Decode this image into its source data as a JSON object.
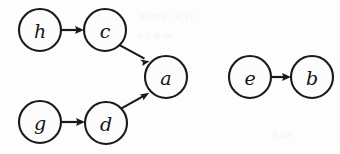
{
  "diagram": {
    "type": "directed-graph",
    "canvas": {
      "width": 340,
      "height": 154,
      "background": "#fdfdfd"
    },
    "style": {
      "node_fill": "#fcfcfc",
      "node_stroke": "#1a1a1a",
      "node_stroke_width": 2.1,
      "node_radius": 21,
      "edge_stroke": "#1a1a1a",
      "edge_stroke_width": 2.2,
      "label_color": "#141414",
      "label_font_size": 19
    },
    "nodes": [
      {
        "id": "h",
        "label": "h",
        "cx": 40,
        "cy": 30,
        "r": 21
      },
      {
        "id": "c",
        "label": "c",
        "cx": 105,
        "cy": 30,
        "r": 21
      },
      {
        "id": "a",
        "label": "a",
        "cx": 166,
        "cy": 77,
        "r": 21
      },
      {
        "id": "g",
        "label": "g",
        "cx": 40,
        "cy": 122,
        "r": 21
      },
      {
        "id": "d",
        "label": "d",
        "cx": 106,
        "cy": 123,
        "r": 21
      },
      {
        "id": "e",
        "label": "e",
        "cx": 250,
        "cy": 77,
        "r": 21
      },
      {
        "id": "b",
        "label": "b",
        "cx": 312,
        "cy": 77,
        "r": 21
      }
    ],
    "edges": [
      {
        "id": "h-c",
        "from": "h",
        "to": "c",
        "directed": true
      },
      {
        "id": "c-a",
        "from": "c",
        "to": "a",
        "directed": true
      },
      {
        "id": "g-d",
        "from": "g",
        "to": "d",
        "directed": true
      },
      {
        "id": "d-a",
        "from": "d",
        "to": "a",
        "directed": true
      },
      {
        "id": "e-b",
        "from": "e",
        "to": "b",
        "directed": true
      }
    ],
    "components": [
      {
        "id": "component-1",
        "nodes": [
          "h",
          "c",
          "g",
          "d",
          "a"
        ]
      },
      {
        "id": "component-2",
        "nodes": [
          "e",
          "b"
        ]
      }
    ],
    "artifacts": [
      {
        "id": "artifact-1",
        "text": "x   sx   y     (c  y)",
        "x": 140,
        "y": 10
      },
      {
        "id": "artifact-2",
        "text": "c    t     n   m",
        "x": 138,
        "y": 30
      },
      {
        "id": "artifact-3",
        "text": "x   sx",
        "x": 272,
        "y": 128
      }
    ]
  }
}
